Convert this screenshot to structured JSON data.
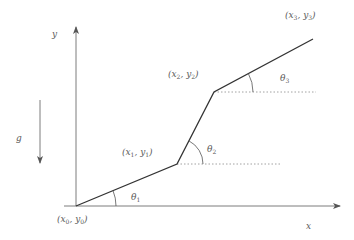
{
  "diagram": {
    "type": "piecewise-linear-path",
    "colors": {
      "axis": "#6e6e6e",
      "segment": "#333333",
      "dotted": "#8a8a8a",
      "label": "#5a5a5a",
      "background": "#ffffff"
    },
    "axes": {
      "x_label": "x",
      "y_label": "y"
    },
    "gravity": {
      "label": "g",
      "direction": "down"
    },
    "points": [
      {
        "id": "p0",
        "label": "(x",
        "sub1": "0",
        "mid": ", y",
        "sub2": "0",
        "end": ")"
      },
      {
        "id": "p1",
        "label": "(x",
        "sub1": "1",
        "mid": ", y",
        "sub2": "1",
        "end": ")"
      },
      {
        "id": "p2",
        "label": "(x",
        "sub1": "2",
        "mid": ", y",
        "sub2": "2",
        "end": ")"
      },
      {
        "id": "p3",
        "label": "(x",
        "sub1": "3",
        "mid": ", y",
        "sub2": "3",
        "end": ")"
      }
    ],
    "angles": [
      {
        "id": "theta1",
        "symbol": "θ",
        "sub": "1"
      },
      {
        "id": "theta2",
        "symbol": "θ",
        "sub": "2"
      },
      {
        "id": "theta3",
        "symbol": "θ",
        "sub": "3"
      }
    ]
  }
}
